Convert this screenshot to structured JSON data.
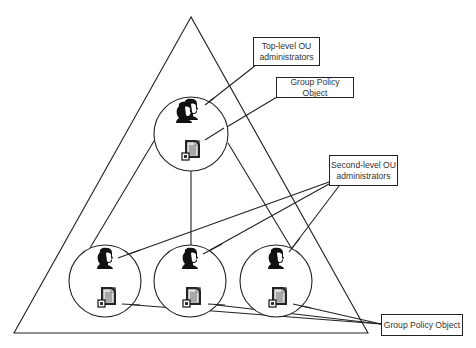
{
  "diagram": {
    "labels": {
      "top_admin": {
        "line1": "Top-level OU",
        "line2": "administrators"
      },
      "top_gpo": {
        "text": "Group Policy Object"
      },
      "second_admin": {
        "line1": "Second-level OU",
        "line2": "administrators"
      },
      "bottom_gpo": {
        "text": "Group Policy Object"
      }
    },
    "nodes": [
      {
        "id": "top-ou",
        "level": "top",
        "icons": [
          "admins-group-icon",
          "group-policy-document-icon"
        ]
      },
      {
        "id": "second-ou-left",
        "level": "second",
        "icons": [
          "admin-icon",
          "group-policy-document-icon"
        ]
      },
      {
        "id": "second-ou-middle",
        "level": "second",
        "icons": [
          "admin-icon",
          "group-policy-document-icon"
        ]
      },
      {
        "id": "second-ou-right",
        "level": "second",
        "icons": [
          "admin-icon",
          "group-policy-document-icon"
        ]
      }
    ],
    "colors": {
      "stroke": "#222222",
      "text": "#333333",
      "background": "#ffffff"
    }
  }
}
